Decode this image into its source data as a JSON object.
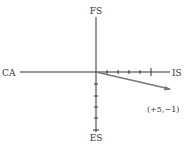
{
  "diagram": {
    "axis_labels": {
      "top": "FS",
      "bottom": "ES",
      "left": "CA",
      "right": "IS"
    },
    "point_label": "(+5,−1)",
    "point": {
      "x": 5,
      "y": -1
    },
    "positive_x_ticks": 5,
    "negative_y_ticks": 5,
    "colors": {
      "axes": "#333333",
      "vector": "#777777",
      "text": "#333333"
    }
  }
}
